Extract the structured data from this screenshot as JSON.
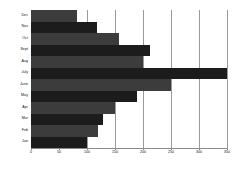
{
  "chart_data": {
    "type": "bar",
    "orientation": "horizontal",
    "title": "",
    "xlabel": "",
    "ylabel": "",
    "xlim": [
      0,
      350
    ],
    "ylim": [
      0,
      12
    ],
    "grid": true,
    "legend": false,
    "xticks": [
      0,
      50,
      100,
      150,
      200,
      250,
      300,
      350
    ],
    "xtick_labels": [
      "0",
      "50",
      "100",
      "150",
      "200",
      "250",
      "300",
      "350"
    ],
    "categories": [
      "Jan",
      "Feb",
      "Mar",
      "Apr",
      "May",
      "June",
      "July",
      "Aug",
      "Sept",
      "Oct",
      "Nov",
      "Dec"
    ],
    "values": [
      100,
      120,
      128,
      150,
      190,
      250,
      350,
      200,
      212,
      158,
      118,
      82
    ],
    "bar_colors": [
      "#1c1c1c",
      "#3c3c3c",
      "#1c1c1c",
      "#3c3c3c",
      "#1c1c1c",
      "#3c3c3c",
      "#1c1c1c",
      "#3c3c3c",
      "#1c1c1c",
      "#3c3c3c",
      "#1c1c1c",
      "#3c3c3c"
    ]
  },
  "colors": {
    "background": "#ffffff",
    "grid": "#9a9a9a",
    "axis": "#8a8a8a",
    "text": "#111111",
    "bar_dark": "#1c1c1c",
    "bar_gray": "#3c3c3c"
  }
}
